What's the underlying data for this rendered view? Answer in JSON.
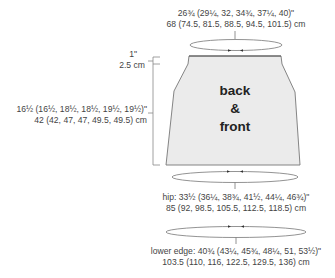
{
  "diagram": {
    "piece_label": [
      "back",
      "&",
      "front"
    ],
    "colors": {
      "fill": "#ebebeb",
      "stroke": "#777777",
      "text": "#444444"
    },
    "top_width": {
      "line1": "26¾ (29¼, 32, 34¾, 37¼, 40)\"",
      "line2": "68 (74.5, 81.5, 88.5, 94.5, 101.5) cm"
    },
    "waistband": {
      "line1": "1\"",
      "line2": "2.5 cm"
    },
    "length": {
      "line1": "16½ (16½, 18½, 18½, 19½, 19½)\"",
      "line2": "42 (42, 47, 47, 49.5, 49.5) cm"
    },
    "hip": {
      "line1": "hip: 33½ (36¼, 38¾, 41½, 44¼, 46¾)\"",
      "line2": "85 (92, 98.5, 105.5, 112.5, 118.5) cm"
    },
    "lower_edge": {
      "line1": "lower edge: 40¾ (43¼, 45¾, 48¼, 51, 53½)\"",
      "line2": "103.5 (110, 116, 122.5, 129.5, 136) cm"
    }
  }
}
